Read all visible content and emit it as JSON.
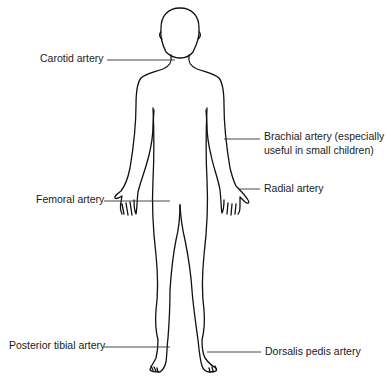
{
  "figure": {
    "labels": {
      "carotid": "Carotid artery",
      "brachial_line1": "Brachial artery (especially",
      "brachial_line2": "useful in small children)",
      "radial": "Radial artery",
      "femoral": "Femoral artery",
      "posterior_tibial": "Posterior tibial artery",
      "dorsalis_pedis": "Dorsalis pedis artery"
    },
    "colors": {
      "line": "#111111",
      "text": "#1a1a1a",
      "background": "#ffffff"
    }
  }
}
